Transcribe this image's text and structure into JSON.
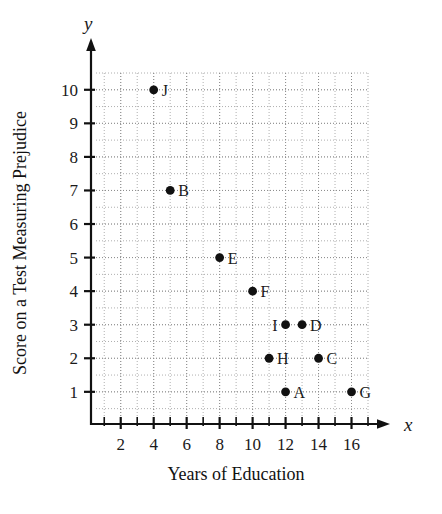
{
  "chart_data": {
    "type": "scatter",
    "title": "",
    "xlabel": "Years of Education",
    "ylabel": "Score on a Test Measuring Prejudice",
    "x_axis_name": "x",
    "y_axis_name": "y",
    "xlim": [
      0.5,
      17
    ],
    "ylim": [
      0.25,
      10.5
    ],
    "xticks": [
      2,
      4,
      6,
      8,
      10,
      12,
      14,
      16
    ],
    "xtick_labels": [
      "2",
      "4",
      "6",
      "8",
      "10",
      "12",
      "14",
      "16"
    ],
    "yticks": [
      1,
      2,
      3,
      4,
      5,
      6,
      7,
      8,
      9,
      10
    ],
    "ytick_labels": [
      "1",
      "2",
      "3",
      "4",
      "5",
      "6",
      "7",
      "8",
      "9",
      "10"
    ],
    "grid": true,
    "grid_style": "dotted",
    "grid_x_step": 1,
    "grid_y_step": 0.5,
    "legend": "none",
    "marker_color": "#111111",
    "points": [
      {
        "label": "A",
        "x": 12,
        "y": 1,
        "label_side": "right"
      },
      {
        "label": "B",
        "x": 5,
        "y": 7,
        "label_side": "right"
      },
      {
        "label": "C",
        "x": 14,
        "y": 2,
        "label_side": "right"
      },
      {
        "label": "D",
        "x": 13,
        "y": 3,
        "label_side": "right"
      },
      {
        "label": "E",
        "x": 8,
        "y": 5,
        "label_side": "right"
      },
      {
        "label": "F",
        "x": 10,
        "y": 4,
        "label_side": "right"
      },
      {
        "label": "G",
        "x": 16,
        "y": 1,
        "label_side": "right"
      },
      {
        "label": "H",
        "x": 11,
        "y": 2,
        "label_side": "right"
      },
      {
        "label": "I",
        "x": 12,
        "y": 3,
        "label_side": "left"
      },
      {
        "label": "J",
        "x": 4,
        "y": 10,
        "label_side": "right"
      }
    ]
  }
}
